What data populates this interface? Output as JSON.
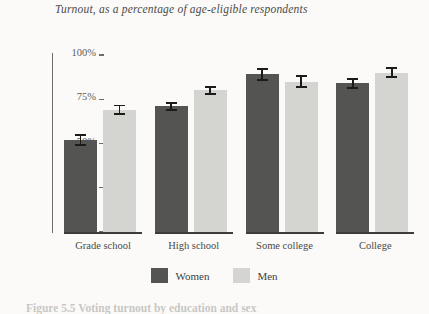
{
  "figure": {
    "title": "Turnout, as a percentage of age-eligible respondents",
    "caption": "Figure 5.5  Voting turnout by education and sex"
  },
  "legend": {
    "items": [
      {
        "label": "Women",
        "color": "#545452"
      },
      {
        "label": "Men",
        "color": "#d4d4d1"
      }
    ]
  },
  "axis": {
    "ticks": [
      {
        "label": "100%",
        "value": 100
      },
      {
        "label": "75%",
        "value": 75
      },
      {
        "label": "50%",
        "value": 50
      },
      {
        "label": "25%",
        "value": 25
      },
      {
        "label": "0%",
        "value": 0
      }
    ]
  },
  "chart_data": {
    "type": "bar",
    "title": "Turnout, as a percentage of age-eligible respondents",
    "xlabel": "",
    "ylabel": "",
    "ylim": [
      0,
      100
    ],
    "ytick_labels": [
      "0%",
      "25%",
      "50%",
      "75%",
      "100%"
    ],
    "grid": false,
    "legend_position": "bottom-center",
    "categories": [
      "Grade school",
      "High school",
      "Some college",
      "College"
    ],
    "series": [
      {
        "name": "Women",
        "color": "#545452",
        "values": [
          52,
          71,
          89,
          84
        ],
        "errors": [
          3.5,
          2.5,
          3.5,
          3.0
        ]
      },
      {
        "name": "Men",
        "color": "#d4d4d1",
        "values": [
          69,
          80,
          85,
          90
        ],
        "errors": [
          3.0,
          2.5,
          3.5,
          3.0
        ]
      }
    ]
  }
}
